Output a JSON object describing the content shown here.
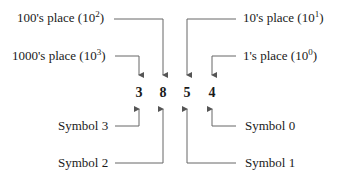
{
  "diagram": {
    "number": "3854",
    "digits": [
      {
        "value": "3",
        "symbol_label": "Symbol 3",
        "place_label": "1000's place (10",
        "exponent": "3"
      },
      {
        "value": "8",
        "symbol_label": "Symbol 2",
        "place_label": "100's place (10",
        "exponent": "2"
      },
      {
        "value": "5",
        "symbol_label": "Symbol 1",
        "place_label": "10's place (10",
        "exponent": "1"
      },
      {
        "value": "4",
        "symbol_label": "Symbol 0",
        "place_label": "1's place (10",
        "exponent": "0"
      }
    ],
    "close_paren": ")",
    "line_color": "#555555"
  }
}
